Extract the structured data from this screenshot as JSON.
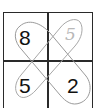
{
  "puzzle": {
    "grid": {
      "rows": 2,
      "cols": 2,
      "cells": [
        {
          "row": 0,
          "col": 0,
          "value": "8",
          "style": "printed"
        },
        {
          "row": 0,
          "col": 1,
          "value": "5",
          "style": "handwritten-faint"
        },
        {
          "row": 1,
          "col": 0,
          "value": "5",
          "style": "printed"
        },
        {
          "row": 1,
          "col": 1,
          "value": "2",
          "style": "printed"
        }
      ]
    },
    "loops": [
      {
        "name": "diagonal-loop-top-left-to-bottom-right",
        "encloses": [
          "8",
          "2"
        ]
      },
      {
        "name": "diagonal-loop-top-right-to-bottom-left",
        "encloses": [
          "5",
          "5"
        ]
      }
    ],
    "colors": {
      "grid_line": "#2a2a2a",
      "loop_stroke": "#9a9a9a",
      "printed_digit": "#111111",
      "faint_digit": "#b8b8b8"
    }
  }
}
